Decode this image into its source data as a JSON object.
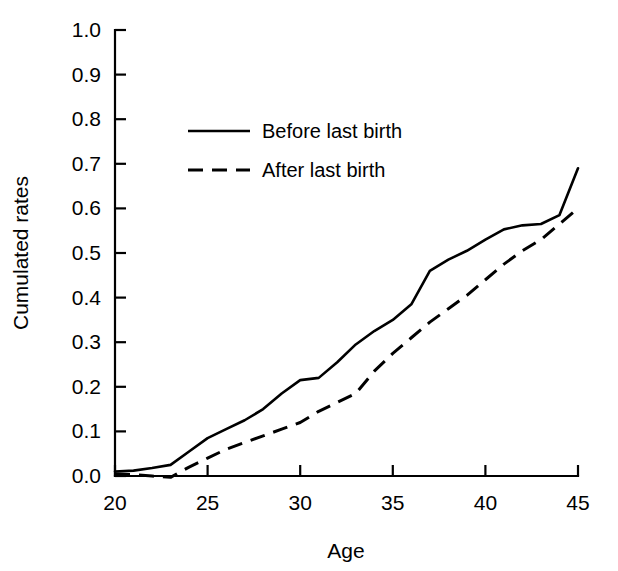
{
  "chart_data": {
    "type": "line",
    "title": "",
    "xlabel": "Age",
    "ylabel": "Cumulated rates",
    "xlim": [
      20,
      45
    ],
    "ylim": [
      0.0,
      1.0
    ],
    "grid": false,
    "legend_position": "upper-left-inside",
    "x_ticks": [
      20,
      25,
      30,
      35,
      40,
      45
    ],
    "x_tick_labels": [
      "20",
      "25",
      "30",
      "35",
      "40",
      "45"
    ],
    "y_ticks": [
      0.0,
      0.1,
      0.2,
      0.3,
      0.4,
      0.5,
      0.6,
      0.7,
      0.8,
      0.9,
      1.0
    ],
    "y_tick_labels": [
      "0.0",
      "0.1",
      "0.2",
      "0.3",
      "0.4",
      "0.5",
      "0.6",
      "0.7",
      "0.8",
      "0.9",
      "1.0"
    ],
    "series": [
      {
        "name": "Before last birth",
        "style": "solid",
        "color": "#000000",
        "x": [
          20,
          21,
          22,
          23,
          24,
          25,
          26,
          27,
          28,
          29,
          30,
          31,
          32,
          33,
          34,
          35,
          36,
          37,
          38,
          39,
          40,
          41,
          42,
          43,
          44,
          45
        ],
        "y": [
          0.01,
          0.012,
          0.018,
          0.025,
          0.055,
          0.085,
          0.105,
          0.125,
          0.15,
          0.185,
          0.215,
          0.22,
          0.255,
          0.295,
          0.325,
          0.35,
          0.385,
          0.46,
          0.485,
          0.505,
          0.53,
          0.553,
          0.562,
          0.565,
          0.585,
          0.69
        ]
      },
      {
        "name": "After last birth",
        "style": "dashed",
        "color": "#000000",
        "x": [
          20,
          21,
          22,
          23,
          24,
          25,
          26,
          27,
          28,
          29,
          30,
          31,
          32,
          33,
          34,
          35,
          36,
          37,
          38,
          39,
          40,
          41,
          42,
          43,
          44,
          45
        ],
        "y": [
          0.005,
          0.003,
          0.0,
          -0.003,
          0.02,
          0.04,
          0.06,
          0.075,
          0.09,
          0.105,
          0.12,
          0.145,
          0.165,
          0.185,
          0.235,
          0.275,
          0.31,
          0.345,
          0.375,
          0.405,
          0.44,
          0.475,
          0.505,
          0.53,
          0.565,
          0.6
        ]
      }
    ],
    "legend": [
      {
        "label": "Before last birth",
        "style": "solid"
      },
      {
        "label": "After last birth",
        "style": "dashed"
      }
    ]
  }
}
